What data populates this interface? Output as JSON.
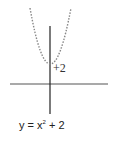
{
  "diagram": {
    "type": "function-graph",
    "function": "y = x^2 + 2",
    "vertex_label": "+2",
    "equation": {
      "lhs": "y = x",
      "exponent": "2",
      "rhs": " + 2"
    },
    "colors": {
      "axis": "#333333",
      "curve": "#888888"
    }
  }
}
